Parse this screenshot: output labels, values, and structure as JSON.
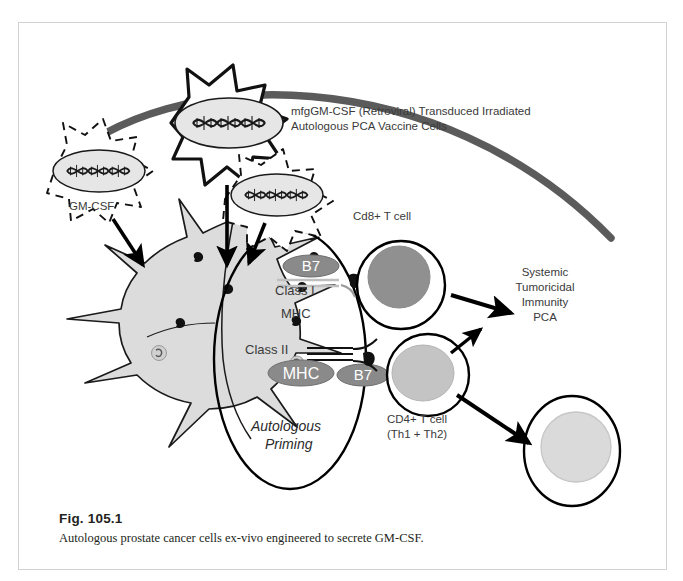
{
  "figure": {
    "caption_title": "Fig. 105.1",
    "caption_text": "Autologous prostate cancer cells ex-vivo engineered to secrete GM-CSF.",
    "border_color": "#d3d3d3",
    "background": "#ffffff"
  },
  "colors": {
    "ink": "#231f20",
    "label_gray": "#3a3a3a",
    "skin_line": "#5b5b5b",
    "cell_fill_light": "#e6e6e6",
    "dendritic_fill": "#dcdcdc",
    "nucleus_mid_gray": "#909090",
    "nucleus_light_gray": "#c4c4c4",
    "nucleus_pale_gray": "#dadada",
    "organelle_gray": "#8a8a8a"
  },
  "labels": {
    "vaccine_cells": "mfgGM-CSF (Retroviral) Transduced Irradiated\nAutologous PCA Vaccine Cells",
    "vaccine_cells_line1": "mfgGM-CSF (Retroviral) Transduced Irradiated",
    "vaccine_cells_line2": "Autologous PCA Vaccine Cells",
    "gm_csf": "GM-CSF",
    "cd8_t_cell": "Cd8+ T cell",
    "cd4_t_cell_line1": "CD4+ T cell",
    "cd4_t_cell_line2": "(Th1 + Th2)",
    "b7_upper": "B7",
    "b7_lower": "B7",
    "class_i": "Class I",
    "mhc_i": "MHC",
    "class_ii": "Class II",
    "mhc_ii": "MHC",
    "autologous_priming_line1": "Autologous",
    "autologous_priming_line2": "Priming",
    "systemic_line1": "Systemic",
    "systemic_line2": "Tumoricidal",
    "systemic_line3": "Immunity",
    "systemic_line4": "PCA"
  },
  "elements": {
    "skin_surface_arc": "skin-surface-arc",
    "vaccine_cell_starburst": "vaccine-cell-starburst",
    "vaccine_cell_dashed_left": "vaccine-cell-dashed-left",
    "vaccine_cell_dashed_right": "vaccine-cell-dashed-right",
    "dendritic_cell": "dendritic-cell",
    "priming_zone": "autologous-priming-zone",
    "cd8_cell": "cd8-t-cell",
    "cd4_cell": "cd4-t-cell",
    "tumor_target_cell": "tumor-target-cell",
    "dna_helix": "dna-helix-icon",
    "antigen_dot": "antigen-dot-icon",
    "tcr_receptor": "tcr-receptor-icon"
  }
}
